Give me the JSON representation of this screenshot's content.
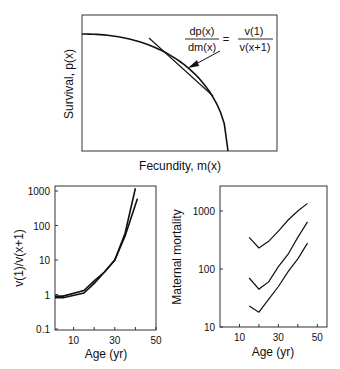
{
  "chart_data": [
    {
      "type": "line",
      "title": "",
      "xlabel": "Fecundity, m(x)",
      "ylabel": "Survival, p(x)",
      "annotation": {
        "lhs_num": "dp(x)",
        "lhs_den": "dm(x)",
        "equals": "=",
        "rhs_num": "v(1)",
        "rhs_den": "v(x+1)"
      },
      "series": [
        {
          "name": "trade-off curve",
          "description": "concave-down survival vs fecundity curve"
        },
        {
          "name": "tangent line",
          "description": "tangent to the curve at the optimum"
        }
      ],
      "grid": false,
      "ticks": false
    },
    {
      "type": "line",
      "xlabel": "Age (yr)",
      "ylabel": "v(1)/v(x+1)",
      "yscale": "log",
      "ylim": [
        0.1,
        1000
      ],
      "xlim": [
        1,
        50
      ],
      "x_ticks": [
        "10",
        "30",
        "50"
      ],
      "y_ticks": [
        "0.1",
        "1",
        "10",
        "100",
        "1000"
      ],
      "series": [
        {
          "name": "series A",
          "x": [
            1,
            5,
            15,
            20,
            25,
            30,
            35,
            40
          ],
          "values": [
            0.9,
            0.9,
            1.3,
            2.5,
            4.5,
            10,
            60,
            1200
          ]
        },
        {
          "name": "series B",
          "x": [
            1,
            5,
            15,
            20,
            25,
            30,
            35,
            41
          ],
          "values": [
            0.8,
            0.8,
            1.1,
            2.1,
            4.5,
            10,
            50,
            600
          ]
        }
      ]
    },
    {
      "type": "line",
      "xlabel": "Age (yr)",
      "ylabel": "Maternal mortality",
      "yscale": "log",
      "ylim": [
        10,
        2500
      ],
      "xlim": [
        0,
        55
      ],
      "x_ticks": [
        "10",
        "30",
        "50"
      ],
      "y_ticks": [
        "10",
        "100",
        "1000"
      ],
      "series": [
        {
          "name": "upper",
          "x": [
            15,
            20,
            25,
            30,
            35,
            40,
            45
          ],
          "values": [
            350,
            230,
            300,
            450,
            700,
            1000,
            1350
          ]
        },
        {
          "name": "middle",
          "x": [
            15,
            20,
            25,
            30,
            35,
            40,
            45
          ],
          "values": [
            70,
            45,
            60,
            110,
            180,
            350,
            650
          ]
        },
        {
          "name": "lower",
          "x": [
            15,
            20,
            25,
            30,
            35,
            40,
            45
          ],
          "values": [
            23,
            18,
            30,
            50,
            90,
            150,
            280
          ]
        }
      ]
    }
  ]
}
